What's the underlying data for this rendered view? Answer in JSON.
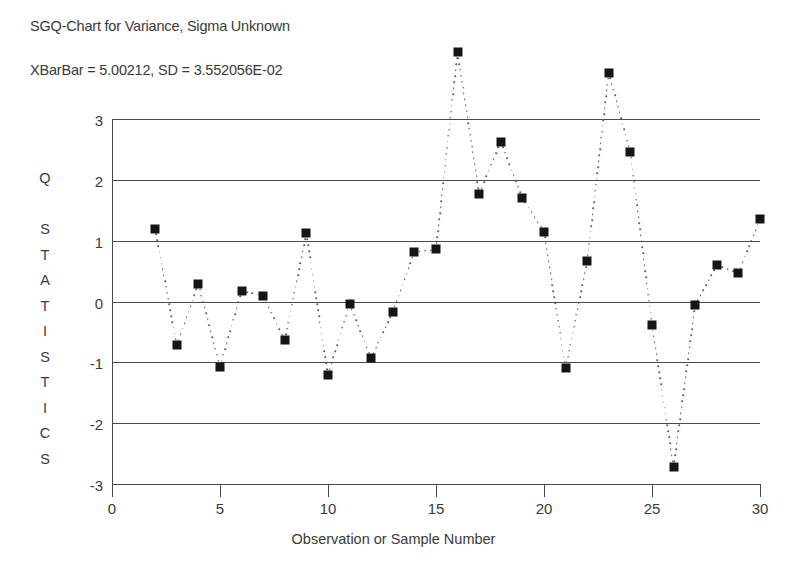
{
  "header": {
    "title": "SGQ-Chart for Variance, Sigma Unknown",
    "subtitle": "XBarBar = 5.00212, SD = 3.552056E-02"
  },
  "axes": {
    "y_label_letters": [
      "Q",
      "",
      "S",
      "T",
      "A",
      "T",
      "I",
      "S",
      "T",
      "I",
      "C",
      "S"
    ],
    "y_label_text": "Q STATISTICS",
    "x_title": "Observation or Sample Number",
    "y_ticks": [
      "3",
      "2",
      "1",
      "0",
      "-1",
      "-2",
      "-3"
    ],
    "x_ticks": [
      "0",
      "5",
      "10",
      "15",
      "20",
      "25",
      "30"
    ]
  },
  "chart_data": {
    "type": "scatter",
    "title": "SGQ-Chart for Variance, Sigma Unknown",
    "subtitle": "XBarBar = 5.00212, SD = 3.552056E-02",
    "xlabel": "Observation or Sample Number",
    "ylabel": "Q STATISTICS",
    "xlim": [
      0,
      30
    ],
    "ylim": [
      -3,
      3
    ],
    "xticks": [
      0,
      5,
      10,
      15,
      20,
      25,
      30
    ],
    "yticks": [
      -3,
      -2,
      -1,
      0,
      1,
      2,
      3
    ],
    "grid": "horizontal",
    "legend": "none",
    "marker": "filled-square",
    "line_style": "dotted",
    "series": [
      {
        "name": "Q statistics",
        "x": [
          2,
          3,
          4,
          5,
          6,
          7,
          8,
          9,
          10,
          11,
          12,
          13,
          14,
          15,
          16,
          17,
          18,
          19,
          20,
          21,
          22,
          23,
          24,
          25,
          26,
          27,
          28,
          29,
          30
        ],
        "y": [
          1.2,
          -0.72,
          0.29,
          -1.07,
          0.18,
          0.09,
          -0.64,
          1.12,
          -1.21,
          -0.04,
          -0.93,
          -0.17,
          0.81,
          0.86,
          4.1,
          1.77,
          2.63,
          1.7,
          1.15,
          -1.1,
          0.66,
          3.76,
          2.46,
          -0.38,
          -2.72,
          -0.06,
          0.6,
          0.47,
          1.35
        ]
      }
    ]
  }
}
